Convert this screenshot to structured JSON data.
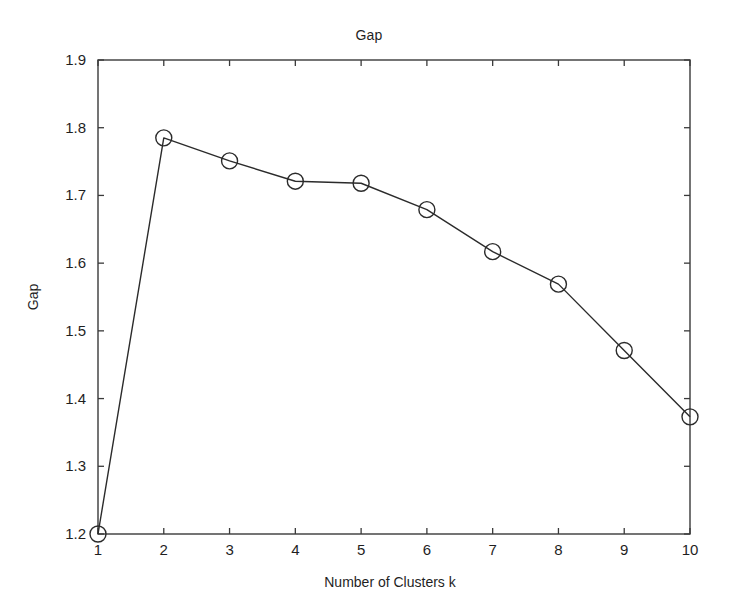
{
  "chart_data": {
    "type": "line",
    "title": "Gap",
    "xlabel": "Number of Clusters k",
    "ylabel": "Gap",
    "x": [
      1,
      2,
      3,
      4,
      5,
      6,
      7,
      8,
      9,
      10
    ],
    "values": [
      1.2,
      1.785,
      1.751,
      1.721,
      1.718,
      1.679,
      1.617,
      1.569,
      1.471,
      1.373
    ],
    "series": [
      {
        "name": "Gap",
        "values": [
          1.2,
          1.785,
          1.751,
          1.721,
          1.718,
          1.679,
          1.617,
          1.569,
          1.471,
          1.373
        ],
        "marker": "circle-open",
        "line_color": "#2b2b2b",
        "marker_color": "#2b2b2b"
      }
    ],
    "categories": [
      "1",
      "2",
      "3",
      "4",
      "5",
      "6",
      "7",
      "8",
      "9",
      "10"
    ],
    "xlim": [
      1,
      10
    ],
    "ylim": [
      1.2,
      1.9
    ],
    "xticks": [
      1,
      2,
      3,
      4,
      5,
      6,
      7,
      8,
      9,
      10
    ],
    "yticks": [
      1.2,
      1.3,
      1.4,
      1.5,
      1.6,
      1.7,
      1.8,
      1.9
    ],
    "xtick_labels": [
      "1",
      "2",
      "3",
      "4",
      "5",
      "6",
      "7",
      "8",
      "9",
      "10"
    ],
    "ytick_labels": [
      "1.2",
      "1.3",
      "1.4",
      "1.5",
      "1.6",
      "1.7",
      "1.8",
      "1.9"
    ],
    "grid": false,
    "legend": null,
    "legend_position": "none",
    "box_axes": true,
    "tick_direction": "in",
    "annotations": [],
    "background_color": "#ffffff",
    "axis_color": "#3a3a3a"
  }
}
